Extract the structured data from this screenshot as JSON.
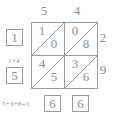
{
  "puzzle": {
    "type": "lattice-multiplication",
    "top_digits": [
      "5",
      "4"
    ],
    "right_digits": [
      "2",
      "9"
    ],
    "cells": [
      {
        "row": 0,
        "col": 0,
        "tens": "1",
        "units": "0"
      },
      {
        "row": 0,
        "col": 1,
        "tens": "0",
        "units": "8"
      },
      {
        "row": 1,
        "col": 0,
        "tens": "4",
        "units": "5"
      },
      {
        "row": 1,
        "col": 1,
        "tens": "3",
        "units": "6"
      }
    ],
    "result_boxes": {
      "left": [
        "1",
        "5"
      ],
      "bottom": [
        "6",
        "6"
      ]
    },
    "annotations": {
      "carry_note": "1+4",
      "sum_note": "5+3+8=1"
    },
    "colors": {
      "line": "#9b9b9b",
      "text": "#8e8e8e",
      "background": "#ffffff"
    }
  }
}
